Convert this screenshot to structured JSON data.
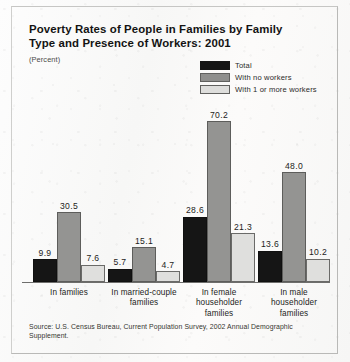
{
  "title": "Poverty Rates of People in Families by Family Type and Presence of Workers:  2001",
  "subtitle": "(Percent)",
  "source": "Source:  U.S. Census Bureau, Current Population Survey, 2002 Annual Demographic Supplement.",
  "legend": [
    {
      "label": "Total",
      "swatch": "total",
      "color": "#151515"
    },
    {
      "label": "With no workers",
      "swatch": "nowork",
      "color": "#949492"
    },
    {
      "label": "With 1 or more workers",
      "swatch": "work",
      "color": "#dfdfdd"
    }
  ],
  "chart_data": {
    "type": "bar",
    "title": "Poverty Rates of People in Families by Family Type and Presence of Workers:  2001",
    "xlabel": "",
    "ylabel": "Percent",
    "ylim": [
      0,
      72
    ],
    "grid": false,
    "legend_position": "top-right",
    "categories": [
      "In families",
      "In married-couple families",
      "In female householder families",
      "In male householder families"
    ],
    "category_lines": [
      [
        "In families"
      ],
      [
        "In married-couple",
        "families"
      ],
      [
        "In female",
        "householder",
        "families"
      ],
      [
        "In male",
        "householder",
        "families"
      ]
    ],
    "series": [
      {
        "name": "Total",
        "color": "#151515",
        "values": [
          9.9,
          5.7,
          28.6,
          13.6
        ]
      },
      {
        "name": "With no workers",
        "color": "#949492",
        "values": [
          30.5,
          15.1,
          70.2,
          48.0
        ]
      },
      {
        "name": "With 1 or more workers",
        "color": "#dfdfdd",
        "values": [
          7.6,
          4.7,
          21.3,
          10.2
        ]
      }
    ],
    "value_labels": [
      [
        "9.9",
        "30.5",
        "7.6"
      ],
      [
        "5.7",
        "15.1",
        "4.7"
      ],
      [
        "28.6",
        "70.2",
        "21.3"
      ],
      [
        "13.6",
        "48.0",
        "10.2"
      ]
    ]
  }
}
